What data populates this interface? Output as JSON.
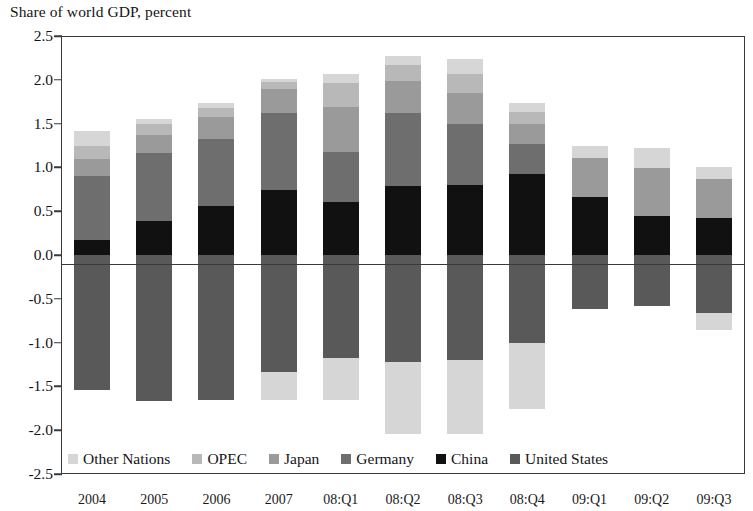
{
  "chart_data": {
    "type": "bar",
    "subtype": "stacked-bar-diverging",
    "title": "Share of world GDP, percent",
    "xlabel": "",
    "ylabel": "",
    "ylim": [
      -2.5,
      2.5
    ],
    "ytick_step": 0.5,
    "yticks": [
      "2.5",
      "2.0",
      "1.5",
      "1.0",
      "0.5",
      "0.0",
      "-0.5",
      "-1.0",
      "-1.5",
      "-2.0",
      "-2.5"
    ],
    "ytick_values": [
      2.5,
      2.0,
      1.5,
      1.0,
      0.5,
      0.0,
      -0.5,
      -1.0,
      -1.5,
      -2.0,
      -2.5
    ],
    "grid": false,
    "legend_position": "inside-bottom-left",
    "categories": [
      "2004",
      "2005",
      "2006",
      "2007",
      "08:Q1",
      "08:Q2",
      "08:Q3",
      "08:Q4",
      "09:Q1",
      "09:Q2",
      "09:Q3"
    ],
    "series": [
      {
        "name": "China",
        "color": "#111111",
        "values": [
          0.17,
          0.39,
          0.56,
          0.74,
          0.61,
          0.79,
          0.8,
          0.93,
          0.66,
          0.44,
          0.42
        ]
      },
      {
        "name": "Germany",
        "color": "#6e6e6e",
        "values": [
          0.73,
          0.77,
          0.76,
          0.88,
          0.57,
          0.83,
          0.7,
          0.34,
          0.0,
          0.0,
          0.0
        ]
      },
      {
        "name": "Japan",
        "color": "#9a9a9a",
        "values": [
          0.2,
          0.21,
          0.25,
          0.27,
          0.51,
          0.37,
          0.35,
          0.22,
          0.45,
          0.55,
          0.45
        ]
      },
      {
        "name": "OPEC",
        "color": "#b8b8b8",
        "values": [
          0.14,
          0.12,
          0.11,
          0.08,
          0.27,
          0.18,
          0.22,
          0.14,
          0.0,
          0.0,
          0.0
        ]
      },
      {
        "name": "Other Nations",
        "color": "#d6d6d6",
        "values": [
          0.17,
          0.06,
          0.06,
          0.04,
          0.11,
          0.1,
          0.17,
          0.11,
          0.13,
          0.23,
          0.14
        ]
      },
      {
        "name": "United States",
        "color": "#595959",
        "values": [
          -1.54,
          -1.67,
          -1.65,
          -1.33,
          -1.18,
          -1.22,
          -1.2,
          -1.0,
          -0.62,
          -0.58,
          -0.66
        ]
      },
      {
        "name": "Other Nations (deficit)",
        "color": "#d6d6d6",
        "values": [
          0.0,
          0.0,
          0.0,
          -0.33,
          -0.47,
          -0.82,
          -0.84,
          -0.76,
          0.0,
          0.0,
          -0.2
        ]
      }
    ],
    "stack_order_positive": [
      "China",
      "Germany",
      "Japan",
      "OPEC",
      "Other Nations"
    ],
    "stack_order_negative": [
      "United States",
      "Other Nations (deficit)"
    ],
    "totals_positive": [
      1.41,
      1.55,
      1.74,
      2.01,
      2.07,
      2.27,
      2.24,
      1.74,
      1.24,
      1.22,
      1.01
    ],
    "totals_negative": [
      -1.54,
      -1.67,
      -1.65,
      -1.66,
      -1.65,
      -2.04,
      -2.04,
      -1.76,
      -0.62,
      -0.58,
      -0.86
    ]
  },
  "legend": {
    "items": [
      {
        "label": "Other Nations",
        "color": "#d6d6d6"
      },
      {
        "label": "OPEC",
        "color": "#b8b8b8"
      },
      {
        "label": "Japan",
        "color": "#9a9a9a"
      },
      {
        "label": "Germany",
        "color": "#6e6e6e"
      },
      {
        "label": "China",
        "color": "#111111"
      },
      {
        "label": "United States",
        "color": "#595959"
      }
    ]
  },
  "style": {
    "axis_color": "#3a3a3a",
    "text_color": "#141414",
    "background": "#ffffff"
  }
}
